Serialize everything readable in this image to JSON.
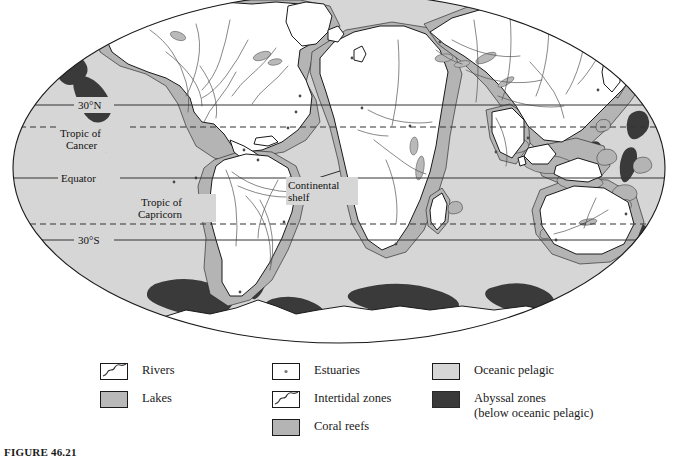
{
  "figure": {
    "caption": "FIGURE 46.21"
  },
  "map": {
    "projection": "elliptical world map",
    "latitude_lines": [
      {
        "id": "lat-30n",
        "label": "30°N",
        "style": "solid",
        "y": 105
      },
      {
        "id": "tropic-cancer",
        "label": "Tropic of\nCancer",
        "style": "dashed",
        "y": 127
      },
      {
        "id": "equator",
        "label": "Equator",
        "style": "solid",
        "y": 178
      },
      {
        "id": "tropic-capricorn",
        "label": "Tropic of\nCapricorn",
        "style": "dashed",
        "y": 224
      },
      {
        "id": "lat-30s",
        "label": "30°S",
        "style": "solid",
        "y": 240
      }
    ],
    "labels": {
      "lat_30n": "30°N",
      "tropic_of_cancer_line1": "Tropic of",
      "tropic_of_cancer_line2": "Cancer",
      "equator": "Equator",
      "tropic_of_capricorn_line1": "Tropic of",
      "tropic_of_capricorn_line2": "Capricorn",
      "lat_30s": "30°S",
      "continental_shelf_line1": "Continental",
      "continental_shelf_line2": "shelf"
    }
  },
  "legend": {
    "columns": [
      {
        "id": "legend-column-1",
        "items": [
          {
            "id": "rivers",
            "label": "Rivers",
            "swatch": "white-with-river-line",
            "color": "#ffffff"
          },
          {
            "id": "lakes",
            "label": "Lakes",
            "swatch": "solid-fill",
            "color": "#b9b9b9"
          }
        ]
      },
      {
        "id": "legend-column-2",
        "items": [
          {
            "id": "estuaries",
            "label": "Estuaries",
            "swatch": "white-with-dot",
            "color": "#ffffff"
          },
          {
            "id": "intertidal-zones",
            "label": "Intertidal zones",
            "swatch": "white-with-river-line",
            "color": "#ffffff"
          },
          {
            "id": "coral-reefs",
            "label": "Coral reefs",
            "swatch": "solid-fill",
            "color": "#b4b4b4"
          }
        ]
      },
      {
        "id": "legend-column-3",
        "items": [
          {
            "id": "oceanic-pelagic",
            "label": "Oceanic pelagic",
            "sublabel": "",
            "swatch": "solid-fill",
            "color": "#d6d6d6"
          },
          {
            "id": "abyssal-zones",
            "label": "Abyssal zones",
            "sublabel": "(below oceanic pelagic)",
            "swatch": "solid-fill",
            "color": "#3a3a3a"
          }
        ]
      }
    ]
  },
  "colors": {
    "oceanic_pelagic": "#d6d6d6",
    "abyssal_zone": "#3a3a3a",
    "continental_shelf": "#b4b4b4",
    "land": "#ffffff",
    "coastline": "#1a1a1a",
    "river": "#555555",
    "graticule": "#2a2a2a",
    "page_background": "#ffffff"
  }
}
